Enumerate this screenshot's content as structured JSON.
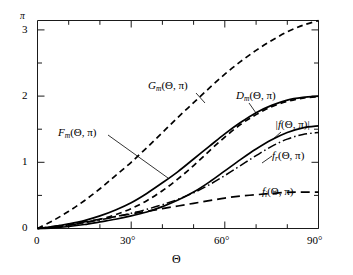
{
  "chart_data": {
    "type": "line",
    "title": "",
    "xlabel": "Θ",
    "ylabel": "",
    "xlim": [
      0,
      90
    ],
    "ylim": [
      0,
      3.1416
    ],
    "grid": false,
    "legend_position": "inline-annotations",
    "x_tick_labels": [
      "0",
      "30°",
      "60°",
      "90°"
    ],
    "x_tick_values": [
      0,
      30,
      60,
      90
    ],
    "x_minor_tick_values": [
      10,
      20,
      40,
      50,
      70,
      80
    ],
    "y_tick_labels": [
      "0",
      "1",
      "2",
      "3"
    ],
    "y_tick_values": [
      0,
      1,
      2,
      3
    ],
    "y_minor_tick_values": [
      0.5,
      1.5,
      2.5
    ],
    "y_axis_top_label": "π",
    "y_axis_top_value": 3.1416,
    "x": [
      0,
      5,
      10,
      15,
      20,
      25,
      30,
      35,
      40,
      45,
      50,
      55,
      60,
      65,
      70,
      75,
      80,
      85,
      90
    ],
    "series": [
      {
        "name": "G_m(Θ, π)",
        "label_main": "G",
        "label_sub": "m",
        "label_args": "(Θ, π)",
        "style": "dashed",
        "values": [
          0.0,
          0.12,
          0.26,
          0.42,
          0.6,
          0.8,
          1.0,
          1.22,
          1.45,
          1.68,
          1.9,
          2.12,
          2.33,
          2.52,
          2.69,
          2.84,
          2.97,
          3.07,
          3.14
        ]
      },
      {
        "name": "D_m(Θ, π)",
        "label_main": "D",
        "label_sub": "m",
        "label_args": "(Θ, π)",
        "style": "dashed",
        "values": [
          0.0,
          0.02,
          0.05,
          0.09,
          0.14,
          0.21,
          0.3,
          0.42,
          0.57,
          0.75,
          0.95,
          1.17,
          1.38,
          1.57,
          1.72,
          1.84,
          1.92,
          1.97,
          1.99
        ]
      },
      {
        "name": "F_m(Θ, π)",
        "label_main": "F",
        "label_sub": "m",
        "label_args": "(Θ, π)",
        "style": "solid",
        "values": [
          0.0,
          0.03,
          0.07,
          0.12,
          0.19,
          0.28,
          0.39,
          0.53,
          0.69,
          0.86,
          1.05,
          1.24,
          1.43,
          1.6,
          1.75,
          1.86,
          1.94,
          1.98,
          2.0
        ]
      },
      {
        "name": "|f(Θ, π)|",
        "label_main": "|f",
        "label_sub": "",
        "label_args": "(Θ, π)|",
        "style": "solid",
        "values": [
          0.0,
          0.01,
          0.03,
          0.06,
          0.1,
          0.14,
          0.19,
          0.25,
          0.33,
          0.43,
          0.55,
          0.7,
          0.87,
          1.04,
          1.2,
          1.34,
          1.45,
          1.52,
          1.55
        ]
      },
      {
        "name": "f_r(Θ, π)",
        "label_main": "f",
        "label_sub": "r",
        "label_args": "(Θ, π)",
        "style": "dashdot",
        "values": [
          0.0,
          0.02,
          0.05,
          0.09,
          0.13,
          0.18,
          0.23,
          0.29,
          0.36,
          0.44,
          0.54,
          0.66,
          0.8,
          0.95,
          1.1,
          1.24,
          1.35,
          1.42,
          1.45
        ]
      },
      {
        "name": "f_i(Θ, π)",
        "label_main": "f",
        "label_sub": "i",
        "label_args": "(Θ, π)",
        "style": "longdash",
        "values": [
          0.0,
          0.03,
          0.06,
          0.1,
          0.14,
          0.18,
          0.22,
          0.26,
          0.3,
          0.34,
          0.38,
          0.42,
          0.46,
          0.49,
          0.51,
          0.53,
          0.545,
          0.55,
          0.55
        ]
      }
    ]
  },
  "labels": {
    "gm": "G",
    "gm_sub": "m",
    "gm_args": "(Θ, π)",
    "dm": "D",
    "dm_sub": "m",
    "dm_args": "(Θ, π)",
    "fm": "F",
    "fm_sub": "m",
    "fm_args": "(Θ, π)",
    "fabs": "|f",
    "fabs_args": "(Θ, π)|",
    "fr": "f",
    "fr_sub": "r",
    "fr_args": "(Θ, π)",
    "fi": "f",
    "fi_sub": "i",
    "fi_args": "(Θ, π)"
  },
  "axes": {
    "x_title": "Θ",
    "y_top": "π",
    "x0": "0",
    "x30": "30°",
    "x60": "60°",
    "x90": "90°",
    "y0": "0",
    "y1": "1",
    "y2": "2",
    "y3": "3"
  }
}
